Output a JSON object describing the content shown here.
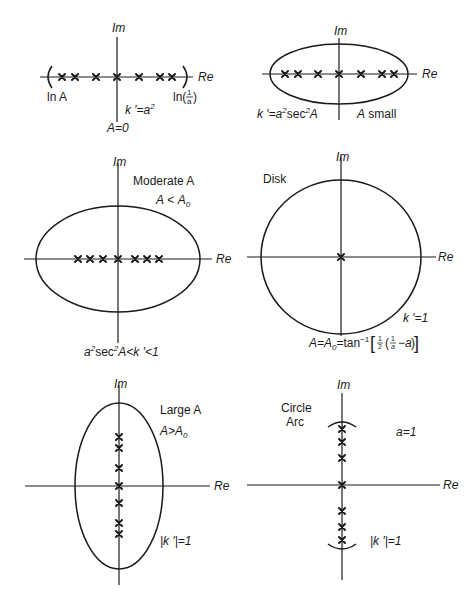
{
  "figure": {
    "colors": {
      "ink": "#1a1a1a",
      "background": "#ffffff"
    }
  },
  "panels": [
    {
      "id": "A-zero",
      "axis_labels": {
        "im": "Im",
        "re": "Re"
      },
      "curve": "interval (bracketed segment on real axis)",
      "zeros_on": "real axis",
      "zero_count": 7,
      "labels": {
        "left_end": "ln A",
        "right_end_prefix": "ln(",
        "right_end_num": "1",
        "right_end_den": "a",
        "right_end_suffix": ")",
        "kprime": "k ′=a",
        "kprime_sup": "2",
        "condition": "A=0"
      }
    },
    {
      "id": "A-small",
      "axis_labels": {
        "im": "Im",
        "re": "Re"
      },
      "curve": "flat ellipse",
      "zeros_on": "real axis",
      "zero_count": 7,
      "labels": {
        "kprime": "k ′=a",
        "kprime_sup1": "2",
        "kprime_mid": "sec",
        "kprime_sup2": "2",
        "kprime_end": "A",
        "condition_var": "A",
        "condition": " small"
      }
    },
    {
      "id": "moderate-A",
      "axis_labels": {
        "im": "Im",
        "re": "Re"
      },
      "curve": "ellipse",
      "zeros_on": "real axis",
      "zero_count": 7,
      "labels": {
        "title": "Moderate A",
        "cond_left": "A",
        "cond_op": " < ",
        "cond_right": "A",
        "cond_sub": "0",
        "range_a": "a",
        "range_sup1": "2",
        "range_sec": "sec",
        "range_sup2": "2",
        "range_rest": "A<k ′<1"
      }
    },
    {
      "id": "disk",
      "axis_labels": {
        "im": "Im",
        "re": "Re"
      },
      "curve": "circle",
      "zeros_on": "origin",
      "zero_count": 1,
      "labels": {
        "title": "Disk",
        "kprime": "k ′=1",
        "formula_lhs": "A=A",
        "formula_sub": "0",
        "formula_mid": "=tan",
        "formula_sup": "−1",
        "formula_half_num": "1",
        "formula_half_den": "2",
        "formula_inv_num": "1",
        "formula_inv_den": "a",
        "formula_tail": "−a"
      }
    },
    {
      "id": "large-A",
      "axis_labels": {
        "im": "Im",
        "re": "Re"
      },
      "curve": "tall ellipse",
      "zeros_on": "imaginary axis",
      "zero_count": 7,
      "labels": {
        "title": "Large A",
        "cond_left": "A>A",
        "cond_sub": "0",
        "kprime": "|k ′|=1"
      }
    },
    {
      "id": "circle-arc",
      "axis_labels": {
        "im": "Im",
        "re": "Re"
      },
      "curve": "two circle arcs",
      "zeros_on": "imaginary axis",
      "zero_count": 7,
      "labels": {
        "title_line1": "Circle",
        "title_line2": "Arc",
        "a_value": "a=1",
        "kprime": "|k ′|=1"
      }
    }
  ]
}
